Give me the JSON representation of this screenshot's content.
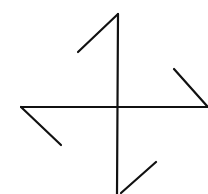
{
  "diagram": {
    "stroke_color": "#111111",
    "background": "#ffffff",
    "lines": [
      {
        "name": "vertical-stem",
        "x1": 118,
        "y1": 14,
        "x2": 117,
        "y2": 194
      },
      {
        "name": "horizontal-stem",
        "x1": 21,
        "y1": 107,
        "x2": 208,
        "y2": 107
      },
      {
        "name": "top-hook",
        "x1": 118,
        "y1": 14,
        "x2": 78,
        "y2": 52
      },
      {
        "name": "right-hook",
        "x1": 207,
        "y1": 106,
        "x2": 174,
        "y2": 69
      },
      {
        "name": "left-hook",
        "x1": 21,
        "y1": 107,
        "x2": 61,
        "y2": 145
      },
      {
        "name": "bottom-hook",
        "x1": 121,
        "y1": 193,
        "x2": 156,
        "y2": 162
      }
    ]
  }
}
